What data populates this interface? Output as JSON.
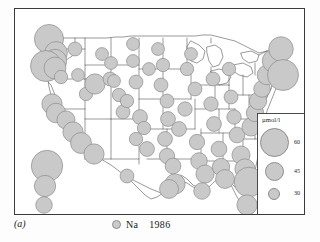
{
  "figure": {
    "panel_label": "(a)",
    "caption_label": "Na",
    "caption_year": "1986",
    "marker_icon": "circle-marker-icon"
  },
  "legend": {
    "title": "µmol/l",
    "entries": [
      {
        "value": "60",
        "radius_px": 14.5
      },
      {
        "value": "45",
        "radius_px": 9.5
      },
      {
        "value": "30",
        "radius_px": 6.0
      }
    ]
  },
  "colors": {
    "symbol_fill": "#c9c9c9",
    "symbol_stroke": "#8d8d8d",
    "map_outline": "#4f4f4f",
    "frame": "#3a3a3a",
    "background": "#ffffff"
  },
  "chart_data": {
    "type": "scatter",
    "title": "Na 1986",
    "subtitle": "",
    "xlabel": "",
    "ylabel": "",
    "value_unit": "µmol/l",
    "symbol": "proportional-circle",
    "legend_position": "inset-right",
    "grid": false,
    "basemap": "contiguous-united-states-with-state-boundaries",
    "legend_breaks": [
      60,
      45,
      30
    ],
    "points": [
      {
        "x": 34,
        "y": 30,
        "v": 62
      },
      {
        "x": 41,
        "y": 44,
        "v": 38
      },
      {
        "x": 40,
        "y": 52,
        "v": 40
      },
      {
        "x": 31,
        "y": 57,
        "v": 70
      },
      {
        "x": 40,
        "y": 59,
        "v": 35
      },
      {
        "x": 37,
        "y": 95,
        "v": 30
      },
      {
        "x": 41,
        "y": 104,
        "v": 28
      },
      {
        "x": 51,
        "y": 111,
        "v": 24
      },
      {
        "x": 58,
        "y": 123,
        "v": 30
      },
      {
        "x": 66,
        "y": 134,
        "v": 32
      },
      {
        "x": 79,
        "y": 145,
        "v": 30
      },
      {
        "x": 32,
        "y": 157,
        "v": 72
      },
      {
        "x": 30,
        "y": 177,
        "v": 33
      },
      {
        "x": 29,
        "y": 196,
        "v": 20
      },
      {
        "x": 60,
        "y": 40,
        "v": 14
      },
      {
        "x": 46,
        "y": 68,
        "v": 13
      },
      {
        "x": 63,
        "y": 66,
        "v": 12
      },
      {
        "x": 87,
        "y": 45,
        "v": 12
      },
      {
        "x": 71,
        "y": 85,
        "v": 13
      },
      {
        "x": 80,
        "y": 75,
        "v": 30
      },
      {
        "x": 95,
        "y": 70,
        "v": 14
      },
      {
        "x": 99,
        "y": 72,
        "v": 12
      },
      {
        "x": 104,
        "y": 86,
        "v": 13
      },
      {
        "x": 108,
        "y": 103,
        "v": 14
      },
      {
        "x": 112,
        "y": 92,
        "v": 13
      },
      {
        "x": 118,
        "y": 35,
        "v": 12
      },
      {
        "x": 118,
        "y": 52,
        "v": 12
      },
      {
        "x": 121,
        "y": 73,
        "v": 14
      },
      {
        "x": 125,
        "y": 108,
        "v": 16
      },
      {
        "x": 129,
        "y": 119,
        "v": 13
      },
      {
        "x": 121,
        "y": 130,
        "v": 13
      },
      {
        "x": 132,
        "y": 140,
        "v": 16
      },
      {
        "x": 143,
        "y": 40,
        "v": 12
      },
      {
        "x": 148,
        "y": 56,
        "v": 13
      },
      {
        "x": 146,
        "y": 76,
        "v": 14
      },
      {
        "x": 152,
        "y": 92,
        "v": 14
      },
      {
        "x": 153,
        "y": 110,
        "v": 16
      },
      {
        "x": 150,
        "y": 130,
        "v": 16
      },
      {
        "x": 152,
        "y": 147,
        "v": 17
      },
      {
        "x": 158,
        "y": 157,
        "v": 18
      },
      {
        "x": 164,
        "y": 120,
        "v": 16
      },
      {
        "x": 170,
        "y": 100,
        "v": 15
      },
      {
        "x": 172,
        "y": 60,
        "v": 13
      },
      {
        "x": 176,
        "y": 45,
        "v": 12
      },
      {
        "x": 180,
        "y": 80,
        "v": 14
      },
      {
        "x": 182,
        "y": 133,
        "v": 17
      },
      {
        "x": 184,
        "y": 152,
        "v": 20
      },
      {
        "x": 190,
        "y": 165,
        "v": 24
      },
      {
        "x": 196,
        "y": 95,
        "v": 15
      },
      {
        "x": 198,
        "y": 70,
        "v": 14
      },
      {
        "x": 199,
        "y": 115,
        "v": 16
      },
      {
        "x": 204,
        "y": 140,
        "v": 18
      },
      {
        "x": 206,
        "y": 158,
        "v": 22
      },
      {
        "x": 210,
        "y": 170,
        "v": 26
      },
      {
        "x": 214,
        "y": 60,
        "v": 13
      },
      {
        "x": 216,
        "y": 88,
        "v": 14
      },
      {
        "x": 219,
        "y": 108,
        "v": 15
      },
      {
        "x": 222,
        "y": 126,
        "v": 18
      },
      {
        "x": 226,
        "y": 146,
        "v": 24
      },
      {
        "x": 230,
        "y": 160,
        "v": 30
      },
      {
        "x": 234,
        "y": 173,
        "v": 64
      },
      {
        "x": 232,
        "y": 196,
        "v": 30
      },
      {
        "x": 236,
        "y": 118,
        "v": 24
      },
      {
        "x": 240,
        "y": 104,
        "v": 22
      },
      {
        "x": 243,
        "y": 92,
        "v": 22
      },
      {
        "x": 247,
        "y": 80,
        "v": 20
      },
      {
        "x": 252,
        "y": 66,
        "v": 28
      },
      {
        "x": 259,
        "y": 52,
        "v": 40
      },
      {
        "x": 266,
        "y": 40,
        "v": 44
      },
      {
        "x": 268,
        "y": 66,
        "v": 70
      },
      {
        "x": 187,
        "y": 182,
        "v": 20
      },
      {
        "x": 160,
        "y": 175,
        "v": 30
      },
      {
        "x": 154,
        "y": 180,
        "v": 26
      },
      {
        "x": 112,
        "y": 167,
        "v": 14
      },
      {
        "x": 96,
        "y": 54,
        "v": 12
      },
      {
        "x": 134,
        "y": 60,
        "v": 12
      }
    ]
  }
}
